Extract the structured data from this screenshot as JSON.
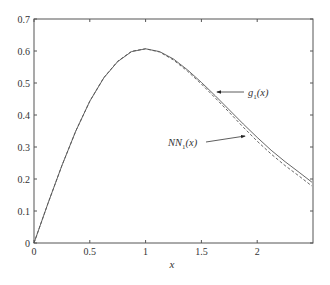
{
  "chart_data": {
    "type": "line",
    "title": "",
    "xlabel": "x",
    "ylabel": "",
    "xlim": [
      0,
      2.5
    ],
    "ylim": [
      0,
      0.7
    ],
    "grid": false,
    "legend": "none (inline arrow annotations)",
    "x_ticks": [
      "0",
      "0.5",
      "1",
      "1.5",
      "2"
    ],
    "x_tick_values": [
      0,
      0.5,
      1,
      1.5,
      2
    ],
    "y_ticks": [
      "0",
      "0.1",
      "0.2",
      "0.3",
      "0.4",
      "0.5",
      "0.6",
      "0.7"
    ],
    "y_tick_values": [
      0,
      0.1,
      0.2,
      0.3,
      0.4,
      0.5,
      0.6,
      0.7
    ],
    "x": [
      0,
      0.125,
      0.25,
      0.375,
      0.5,
      0.625,
      0.75,
      0.875,
      1.0,
      1.125,
      1.25,
      1.375,
      1.5,
      1.625,
      1.75,
      1.875,
      2.0,
      2.125,
      2.25,
      2.375,
      2.49
    ],
    "series": [
      {
        "name": "g1(x)",
        "style": "solid",
        "values": [
          0.0,
          0.124,
          0.242,
          0.35,
          0.443,
          0.516,
          0.567,
          0.598,
          0.607,
          0.598,
          0.575,
          0.541,
          0.502,
          0.46,
          0.416,
          0.372,
          0.33,
          0.29,
          0.254,
          0.221,
          0.19
        ]
      },
      {
        "name": "NN1(x)",
        "style": "dashed",
        "values": [
          0.0,
          0.124,
          0.242,
          0.35,
          0.443,
          0.517,
          0.568,
          0.599,
          0.607,
          0.597,
          0.572,
          0.537,
          0.497,
          0.453,
          0.408,
          0.362,
          0.318,
          0.278,
          0.242,
          0.209,
          0.178
        ]
      }
    ],
    "annotations": [
      {
        "label_base": "g",
        "label_sub": "1",
        "label_tail": "(x)",
        "text": "g1(x)",
        "text_x": 248,
        "text_y": 96,
        "arrow_from": [
          244,
          92
        ],
        "arrow_to": [
          217,
          92
        ]
      },
      {
        "label_base": "NN",
        "label_sub": "1",
        "label_tail": "(x)",
        "text": "NN1(x)",
        "text_x": 168,
        "text_y": 146,
        "arrow_from": [
          206,
          142
        ],
        "arrow_to": [
          245,
          136
        ]
      }
    ]
  },
  "layout": {
    "plot_left": 34,
    "plot_right": 313,
    "plot_top": 19,
    "plot_bottom": 243
  },
  "colors": {
    "axis": "#555555",
    "line": "#555555",
    "text": "#333333"
  }
}
